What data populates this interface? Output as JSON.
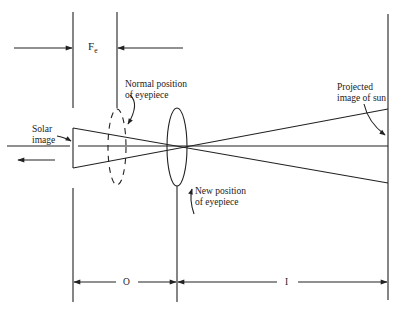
{
  "diagram": {
    "labels": {
      "focal_length_main": "F",
      "focal_length_sub": "e",
      "normal_position_line1": "Normal position",
      "normal_position_line2": "of eyepiece",
      "solar_image_line1": "Solar",
      "solar_image_line2": "image",
      "new_position_line1": "New position",
      "new_position_line2": "of eyepiece",
      "projected_image_line1": "Projected",
      "projected_image_line2": "image of sun",
      "object_distance": "O",
      "image_distance": "I"
    },
    "colors": {
      "stroke": "#222222",
      "background": "#ffffff"
    }
  }
}
